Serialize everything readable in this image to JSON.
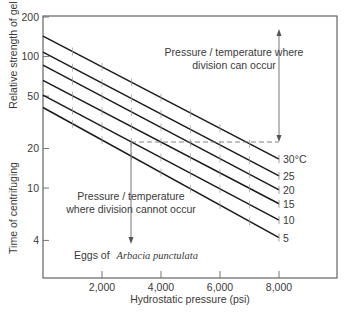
{
  "chart_data": {
    "type": "line",
    "title": "",
    "xlabel": "Hydrostatic pressure (psi)",
    "ylabel_upper": "Relative strength of gel",
    "ylabel_lower": "Time of centrifuging",
    "y_scale": "log",
    "xlim": [
      0,
      9800
    ],
    "ylim": [
      2.6,
      200
    ],
    "x_ticks": [
      2000,
      4000,
      6000,
      8000
    ],
    "x_tick_labels": [
      "2,000",
      "4,000",
      "6,000",
      "8,000"
    ],
    "y_ticks": [
      200,
      100,
      50,
      20,
      10,
      4
    ],
    "y_tick_labels": [
      "200",
      "100",
      "50",
      "20",
      "10",
      "4"
    ],
    "grid": false,
    "x": [
      0,
      8000
    ],
    "series": [
      {
        "name": "30°C",
        "label": "30°C",
        "values": [
          143,
          16.6
        ]
      },
      {
        "name": "25",
        "label": "25",
        "values": [
          108,
          12.4
        ]
      },
      {
        "name": "20",
        "label": "20",
        "values": [
          86,
          9.7
        ]
      },
      {
        "name": "15",
        "label": "15",
        "values": [
          66,
          7.6
        ]
      },
      {
        "name": "10",
        "label": "10",
        "values": [
          51,
          5.7
        ]
      },
      {
        "name": "5",
        "label": "5",
        "values": [
          41,
          4.2
        ]
      }
    ],
    "minor_marks_on_lines_psi": [
      1000,
      2000,
      3000,
      4000,
      5000,
      6000,
      7000
    ],
    "annotations": [
      {
        "text_line1": "Pressure / temperature where",
        "text_line2": "division can occur",
        "arrow": "double vertical at 8,000 psi from ~21 up to ~150"
      },
      {
        "text_line1": "Pressure / temperature",
        "text_line2": "where division cannot occur",
        "arrow": "down arrow at 3,000 psi from ~21 down to ~4"
      },
      {
        "text_prefix": "Eggs of ",
        "text_species": "Arbacia punctulata"
      }
    ],
    "threshold_dashed_y": 21,
    "legend_position": "right-end line labels"
  },
  "labels": {
    "xlabel": "Hydrostatic pressure (psi)",
    "ylabel_upper": "Relative strength of gel",
    "ylabel_lower": "Time of centrifuging",
    "ann_can_1": "Pressure / temperature where",
    "ann_can_2": "division can occur",
    "ann_cannot_1": "Pressure / temperature",
    "ann_cannot_2": "where division cannot occur",
    "eggs_prefix": "Eggs of",
    "eggs_species": "Arbacia punctulata"
  }
}
